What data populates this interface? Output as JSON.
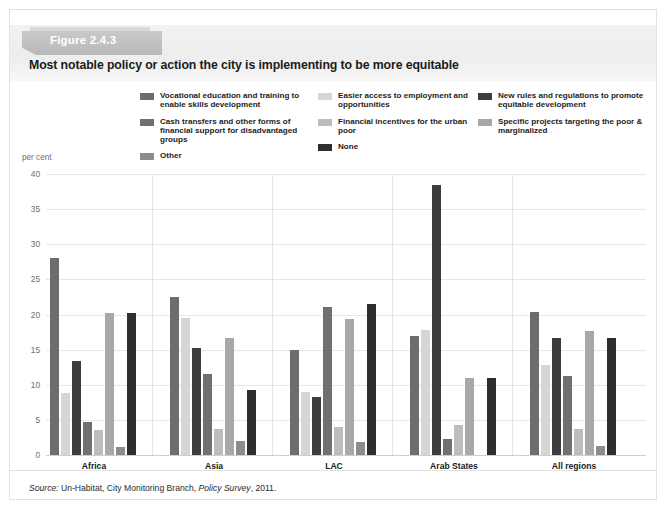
{
  "figure": {
    "tab_label": "Figure 2.4.3",
    "title": "Most notable policy or action the city is implementing to be more equitable",
    "axis_unit_label": "per cent",
    "source_prefix": "Source:",
    "source_text": " Un-Habitat, City Monitoring Branch, ",
    "source_italic": "Policy Survey",
    "source_suffix": ", 2011."
  },
  "legend": {
    "columns": [
      [
        {
          "label": "Vocational education and training to enable skills development",
          "color": "#6d6d6d"
        },
        {
          "label": "Cash transfers and other forms of financial support for disadvantaged groups",
          "color": "#707070"
        },
        {
          "label": "Other",
          "color": "#8c8c8c"
        }
      ],
      [
        {
          "label": "Easier access to employment and opportunities",
          "color": "#d6d6d6"
        },
        {
          "label": "Financial incentives for the urban poor",
          "color": "#bdbdbd"
        },
        {
          "label": "None",
          "color": "#2e2e2e"
        }
      ],
      [
        {
          "label": "New rules and regulations to promote equitable development",
          "color": "#3d3d3d"
        },
        {
          "label": "Specific projects targeting the poor & marginalized",
          "color": "#a8a8a8"
        }
      ]
    ]
  },
  "chart_data": {
    "type": "bar",
    "title": "Most notable policy or action the city is implementing to be more equitable",
    "xlabel": "",
    "ylabel": "per cent",
    "ylim": [
      0,
      40
    ],
    "yticks": [
      0,
      5,
      10,
      15,
      20,
      25,
      30,
      35,
      40
    ],
    "grid": true,
    "legend_position": "top",
    "categories": [
      "Africa",
      "Asia",
      "LAC",
      "Arab States",
      "All regions"
    ],
    "series": [
      {
        "name": "Vocational education and training to enable skills development",
        "color": "#6d6d6d",
        "values": [
          28.0,
          22.5,
          15.0,
          17.0,
          20.4
        ]
      },
      {
        "name": "Easier access to employment and opportunities",
        "color": "#d6d6d6",
        "values": [
          8.8,
          19.5,
          8.9,
          17.8,
          12.8
        ]
      },
      {
        "name": "New rules and regulations to promote equitable development",
        "color": "#3d3d3d",
        "values": [
          13.4,
          15.3,
          8.2,
          38.5,
          16.6
        ]
      },
      {
        "name": "Cash transfers and other forms of financial support for disadvantaged groups",
        "color": "#707070",
        "values": [
          4.7,
          11.6,
          21.1,
          2.3,
          11.3
        ]
      },
      {
        "name": "Financial incentives for the urban poor",
        "color": "#bdbdbd",
        "values": [
          3.6,
          3.7,
          4.0,
          4.3,
          3.7
        ]
      },
      {
        "name": "Specific projects targeting the poor & marginalized",
        "color": "#a8a8a8",
        "values": [
          20.2,
          16.6,
          19.4,
          10.9,
          17.6
        ]
      },
      {
        "name": "Other",
        "color": "#8c8c8c",
        "values": [
          1.1,
          2.0,
          1.8,
          0.0,
          1.3
        ]
      },
      {
        "name": "None",
        "color": "#2e2e2e",
        "values": [
          20.2,
          9.2,
          21.5,
          10.9,
          16.7
        ]
      }
    ]
  }
}
